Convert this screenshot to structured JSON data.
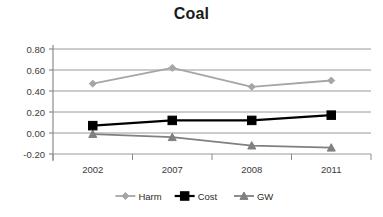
{
  "chart_data": {
    "type": "line",
    "title": "Coal",
    "xlabel": "",
    "ylabel": "",
    "x": [
      "2002",
      "2007",
      "2008",
      "2011"
    ],
    "categories": [
      "2002",
      "2007",
      "2008",
      "2011"
    ],
    "series": [
      {
        "name": "Harm",
        "values": [
          0.47,
          0.62,
          0.44,
          0.5
        ],
        "color": "#a6a6a6",
        "marker": "diamond"
      },
      {
        "name": "Cost",
        "values": [
          0.07,
          0.12,
          0.12,
          0.17
        ],
        "color": "#000000",
        "marker": "square"
      },
      {
        "name": "GW",
        "values": [
          -0.01,
          -0.04,
          -0.12,
          -0.14
        ],
        "color": "#808080",
        "marker": "triangle"
      }
    ],
    "ylim": [
      -0.2,
      0.8
    ],
    "yticks": [
      0.8,
      0.6,
      0.4,
      0.2,
      0.0,
      -0.2
    ],
    "ytick_labels": [
      "0.80",
      "0.60",
      "0.40",
      "0.20",
      "0.00",
      "-0.20"
    ],
    "grid": true,
    "legend_position": "bottom"
  },
  "legend": {
    "items": [
      {
        "label": "Harm"
      },
      {
        "label": "Cost"
      },
      {
        "label": "GW"
      }
    ]
  },
  "axes": {
    "y_labels": [
      "0.80",
      "0.60",
      "0.40",
      "0.20",
      "0.00",
      "-0.20"
    ],
    "x_labels": [
      "2002",
      "2007",
      "2008",
      "2011"
    ]
  },
  "colors": {
    "harm": "#a6a6a6",
    "cost": "#000000",
    "gw": "#808080",
    "gridline": "#9a9a9a",
    "axis": "#8c8c8c",
    "text": "#3a3a3a",
    "title": "#1a1a1a",
    "background": "#ffffff"
  }
}
